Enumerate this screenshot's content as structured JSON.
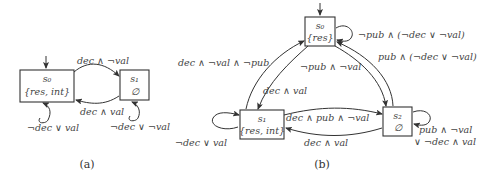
{
  "figure_a": {
    "caption": "(a)",
    "states": [
      {
        "name": "s0",
        "label": "{res, int}"
      },
      {
        "name": "s1",
        "label": "∅"
      }
    ],
    "edges": [
      {
        "from": "s0",
        "to": "s1",
        "label": "dec ∧ ¬val"
      },
      {
        "from": "s1",
        "to": "s0",
        "label": "dec ∧ val"
      },
      {
        "from": "s0",
        "to": "s0",
        "label": "¬dec ∨ val"
      },
      {
        "from": "s1",
        "to": "s1",
        "label": "¬dec ∨ ¬val"
      }
    ],
    "initial": "s0"
  },
  "figure_b": {
    "caption": "(b)",
    "states": [
      {
        "name": "s0",
        "label": "{res}"
      },
      {
        "name": "s1",
        "label": "{res, int}"
      },
      {
        "name": "s2",
        "label": "∅"
      }
    ],
    "edges": [
      {
        "from": "s0",
        "to": "s0",
        "label": "¬pub ∧ (¬dec ∨ ¬val)"
      },
      {
        "from": "s2",
        "to": "s0",
        "label": "pub ∧ (¬dec ∨ ¬val)"
      },
      {
        "from": "s1",
        "to": "s0",
        "label": "dec ∧ ¬val ∧ ¬pub"
      },
      {
        "from": "s0",
        "to": "s2",
        "label": "¬pub ∧ ¬val"
      },
      {
        "from": "s0",
        "to": "s1",
        "label": "dec ∧ val"
      },
      {
        "from": "s1",
        "to": "s2",
        "label": "dec ∧ pub ∧ ¬val"
      },
      {
        "from": "s2",
        "to": "s1",
        "label": "dec ∧ val"
      },
      {
        "from": "s1",
        "to": "s1",
        "label": "¬dec ∨ val"
      },
      {
        "from": "s2",
        "to": "s2",
        "label_line1": "pub ∧ ¬val",
        "label_line2": "∨ ¬dec ∧ val"
      }
    ],
    "initial": "s0"
  }
}
